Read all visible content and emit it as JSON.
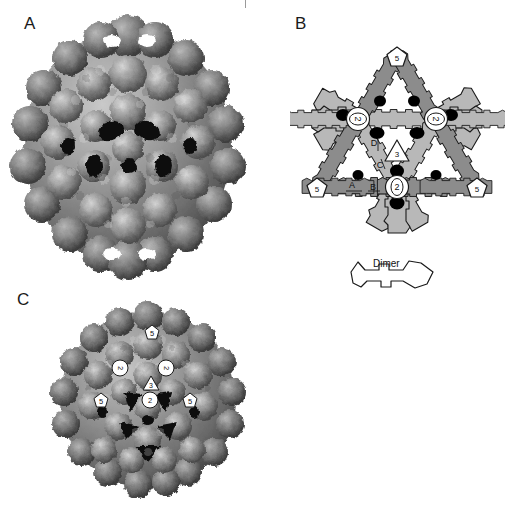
{
  "figure": {
    "panels": [
      {
        "id": "A",
        "letter": "A",
        "type": "capsid-surface-render",
        "description": "Shaded surface representation of icosahedral virus capsid viewed along a two-fold axis"
      },
      {
        "id": "B",
        "letter": "B",
        "type": "schematic-diagram",
        "description": "Schematic of capsid subunit organization showing dimers around symmetry axes"
      },
      {
        "id": "C",
        "letter": "C",
        "type": "capsid-surface-render",
        "description": "Shaded surface representation of complete capsid with symmetry axes labelled"
      }
    ]
  },
  "schematic": {
    "axis_markers": [
      {
        "label": "5",
        "shape": "pentagon",
        "name": "five-fold-axis-top",
        "x": 107,
        "y": 22
      },
      {
        "label": "5",
        "shape": "pentagon",
        "name": "five-fold-axis-left",
        "x": 27,
        "y": 153
      },
      {
        "label": "5",
        "shape": "pentagon",
        "name": "five-fold-axis-right",
        "x": 187,
        "y": 153
      },
      {
        "label": "2",
        "shape": "ellipse",
        "name": "two-fold-axis-upper-left",
        "x": 68,
        "y": 84
      },
      {
        "label": "2",
        "shape": "ellipse",
        "name": "two-fold-axis-upper-right",
        "x": 146,
        "y": 84
      },
      {
        "label": "2",
        "shape": "ellipse",
        "name": "two-fold-axis-bottom",
        "x": 107,
        "y": 152
      },
      {
        "label": "3",
        "shape": "triangle",
        "name": "three-fold-axis-center",
        "x": 107,
        "y": 115
      }
    ],
    "subunit_labels": [
      {
        "label": "A",
        "name": "subunit-a",
        "x": 62,
        "y": 150
      },
      {
        "label": "B",
        "name": "subunit-b",
        "x": 83,
        "y": 152
      },
      {
        "label": "C",
        "name": "subunit-c",
        "x": 90,
        "y": 130
      },
      {
        "label": "D",
        "name": "subunit-d",
        "x": 84,
        "y": 108
      }
    ],
    "colors": {
      "dimer_light": "#b8b8b8",
      "dimer_dark": "#8c8c8c",
      "dimer_mid": "#a6a6a6",
      "outline": "#1a1a1a",
      "contact_dot": "#000000",
      "marker_fill": "#ffffff"
    }
  },
  "dimer_key": {
    "label": "Dimer",
    "name": "dimer-legend"
  },
  "capsid_markers_c": [
    {
      "label": "5",
      "name": "c-five-fold-top",
      "x": 104,
      "y": 32
    },
    {
      "label": "5",
      "name": "c-five-fold-left",
      "x": 53,
      "y": 100
    },
    {
      "label": "5",
      "name": "c-five-fold-right",
      "x": 142,
      "y": 100
    },
    {
      "label": "2",
      "name": "c-two-fold-left",
      "x": 72,
      "y": 68
    },
    {
      "label": "2",
      "name": "c-two-fold-right",
      "x": 118,
      "y": 68
    },
    {
      "label": "2",
      "name": "c-two-fold-bottom",
      "x": 102,
      "y": 100
    },
    {
      "label": "3",
      "name": "c-three-fold",
      "x": 103,
      "y": 83
    }
  ],
  "render": {
    "surface_highlight": "#d8d8d8",
    "surface_mid": "#9e9e9e",
    "surface_shadow": "#5e5e5e",
    "surface_deep": "#2a2a2a",
    "background": "#ffffff"
  }
}
